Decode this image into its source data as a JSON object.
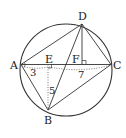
{
  "diagram": {
    "type": "geometry",
    "circle": {
      "cx": 66,
      "cy": 70,
      "r": 46
    },
    "points": {
      "A": {
        "label": "A",
        "x": 21,
        "y": 64.5
      },
      "B": {
        "label": "B",
        "x": 48,
        "y": 110
      },
      "C": {
        "label": "C",
        "x": 111,
        "y": 64.5
      },
      "D": {
        "label": "D",
        "x": 82,
        "y": 24
      },
      "E": {
        "label": "E",
        "x": 48,
        "y": 64.5
      },
      "F": {
        "label": "F",
        "x": 82,
        "y": 64.5
      }
    },
    "segments_solid": [
      "AD",
      "DC",
      "AB",
      "BC",
      "AC",
      "DB",
      "DF"
    ],
    "segments_dotted": [
      "EB",
      "A-to-C lower measure"
    ],
    "right_angles": [
      "E",
      "F"
    ],
    "measurements": {
      "AE": "3",
      "EB": "5",
      "EC": "7"
    }
  }
}
